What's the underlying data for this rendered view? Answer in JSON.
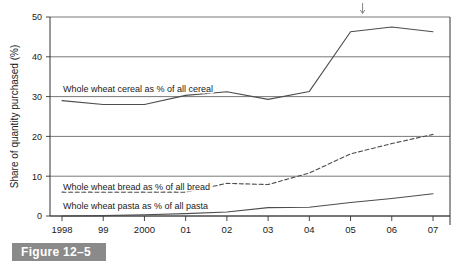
{
  "figure": {
    "caption": "Figure 12–5"
  },
  "chart_data": {
    "type": "line",
    "title": "",
    "xlabel": "",
    "ylabel": "Share of quantity purchased (%)",
    "categories": [
      "1998",
      "99",
      "2000",
      "01",
      "02",
      "03",
      "04",
      "05",
      "06",
      "07"
    ],
    "x_tick_labels": [
      "1998",
      "99",
      "2000",
      "01",
      "02",
      "03",
      "04",
      "05",
      "06",
      "07"
    ],
    "y_tick_labels": [
      "0",
      "10",
      "20",
      "30",
      "40",
      "50"
    ],
    "y_ticks": [
      0,
      10,
      20,
      30,
      40,
      50
    ],
    "ylim": [
      0,
      50
    ],
    "grid": "horizontal",
    "legend_position": "inline-annotations",
    "series": [
      {
        "name": "Whole wheat cereal as % of all cereal",
        "label": "Whole wheat cereal as % of all cereal",
        "style": "solid",
        "color": "#4d4d4d",
        "values": [
          29.0,
          28.0,
          28.0,
          30.3,
          31.2,
          29.3,
          31.3,
          46.3,
          47.5,
          46.3
        ]
      },
      {
        "name": "Whole wheat bread as % of all bread",
        "label": "Whole wheat bread as % of all bread",
        "style": "dashed",
        "color": "#4d4d4d",
        "values": [
          6.0,
          6.0,
          6.0,
          6.0,
          8.2,
          7.9,
          10.8,
          15.6,
          18.2,
          20.5
        ]
      },
      {
        "name": "Whole wheat pasta as % of all pasta",
        "label": "Whole wheat pasta as % of all pasta",
        "style": "solid",
        "color": "#4d4d4d",
        "values": [
          0.0,
          0.1,
          0.3,
          0.6,
          1.0,
          2.1,
          2.2,
          3.4,
          4.4,
          5.6
        ]
      }
    ],
    "annotations": [
      {
        "name": "down-arrow-marker",
        "glyph": "↓",
        "x_value": "05",
        "note": ""
      }
    ]
  }
}
